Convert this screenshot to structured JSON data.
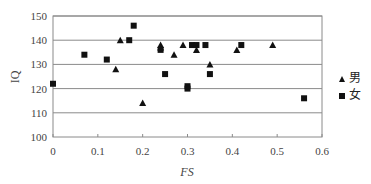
{
  "chart_data": {
    "type": "scatter",
    "title": "",
    "xlabel": "FS",
    "ylabel": "IQ",
    "xlim": [
      0,
      0.6
    ],
    "ylim": [
      100,
      150
    ],
    "xticks": [
      0,
      0.1,
      0.2,
      0.3,
      0.4,
      0.5,
      0.6
    ],
    "xtick_labels": [
      "0",
      "0.1",
      "0.2",
      "0.3",
      "0.4",
      "0.5",
      "0.6"
    ],
    "yticks": [
      100,
      110,
      120,
      130,
      140,
      150
    ],
    "ytick_labels": [
      "100",
      "110",
      "120",
      "130",
      "140",
      "150"
    ],
    "grid": "horizontal",
    "legend_position": "right",
    "series": [
      {
        "name": "男",
        "marker": "triangle",
        "color": "#111111",
        "points": [
          [
            0.14,
            128
          ],
          [
            0.15,
            140
          ],
          [
            0.2,
            114
          ],
          [
            0.24,
            138
          ],
          [
            0.24,
            137
          ],
          [
            0.27,
            134
          ],
          [
            0.29,
            138
          ],
          [
            0.32,
            136
          ],
          [
            0.35,
            130
          ],
          [
            0.41,
            136
          ],
          [
            0.49,
            138
          ]
        ]
      },
      {
        "name": "女",
        "marker": "square",
        "color": "#111111",
        "points": [
          [
            0.0,
            122
          ],
          [
            0.07,
            134
          ],
          [
            0.12,
            132
          ],
          [
            0.17,
            140
          ],
          [
            0.18,
            146
          ],
          [
            0.24,
            136
          ],
          [
            0.25,
            126
          ],
          [
            0.3,
            121
          ],
          [
            0.3,
            120
          ],
          [
            0.31,
            138
          ],
          [
            0.32,
            138
          ],
          [
            0.34,
            138
          ],
          [
            0.35,
            126
          ],
          [
            0.42,
            138
          ],
          [
            0.56,
            116
          ]
        ]
      }
    ]
  },
  "legend": {
    "items": [
      {
        "label": "男",
        "marker": "triangle"
      },
      {
        "label": "女",
        "marker": "square"
      }
    ]
  }
}
